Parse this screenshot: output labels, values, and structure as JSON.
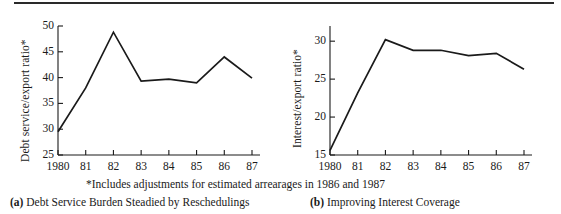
{
  "figure": {
    "footnote": "*Includes adjustments for estimated arrearages in 1986 and 1987",
    "rule_color": "#2a2a2a",
    "line_color": "#1a1a1a"
  },
  "panels": [
    {
      "key": "a",
      "caption_tag": "(a)",
      "caption_text": "Debt Service Burden Steadied by Reschedulings"
    },
    {
      "key": "b",
      "caption_tag": "(b)",
      "caption_text": "Improving Interest Coverage"
    }
  ],
  "chart_data": [
    {
      "type": "line",
      "panel": "a",
      "title": "Debt Service Burden Steadied by Reschedulings",
      "xlabel": "",
      "ylabel": "Debt service/export ratio*",
      "categories": [
        "1980",
        "81",
        "82",
        "83",
        "84",
        "85",
        "86",
        "87"
      ],
      "x": [
        1980,
        1981,
        1982,
        1983,
        1984,
        1985,
        1986,
        1987
      ],
      "values": [
        29.5,
        38.0,
        48.8,
        39.3,
        39.7,
        39.0,
        44.0,
        39.9
      ],
      "yticks": [
        25,
        30,
        35,
        40,
        45,
        50
      ],
      "ytick_labels": [
        "25",
        "30",
        "35",
        "40",
        "45",
        "50"
      ],
      "ylim": [
        25,
        50
      ],
      "xlim": [
        1980,
        1987
      ],
      "grid": false,
      "legend": null,
      "annotations": [
        "*Includes adjustments for estimated arrearages in 1986 and 1987"
      ]
    },
    {
      "type": "line",
      "panel": "b",
      "title": "Improving Interest Coverage",
      "xlabel": "",
      "ylabel": "Interest/export ratio*",
      "categories": [
        "1980",
        "81",
        "82",
        "83",
        "84",
        "85",
        "86",
        "87"
      ],
      "x": [
        1980,
        1981,
        1982,
        1983,
        1984,
        1985,
        1986,
        1987
      ],
      "values": [
        15.6,
        23.2,
        30.2,
        28.8,
        28.8,
        28.1,
        28.4,
        26.3
      ],
      "yticks": [
        15,
        20,
        25,
        30
      ],
      "ytick_labels": [
        "15",
        "20",
        "25",
        "30"
      ],
      "ylim": [
        15,
        32
      ],
      "xlim": [
        1980,
        1987
      ],
      "grid": false,
      "legend": null,
      "annotations": [
        "*Includes adjustments for estimated arrearages in 1986 and 1987"
      ]
    }
  ]
}
